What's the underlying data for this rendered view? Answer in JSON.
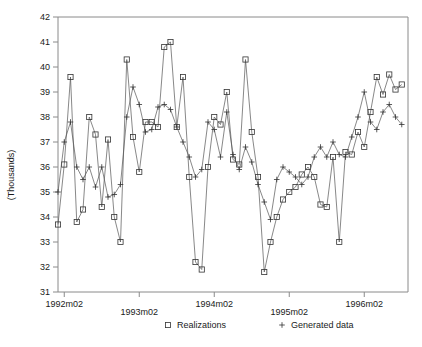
{
  "chart_data": {
    "type": "line",
    "title": "",
    "xlabel": "",
    "ylabel": "(Thousands)",
    "ylim": [
      31,
      42
    ],
    "yticks": [
      31,
      32,
      33,
      34,
      35,
      36,
      37,
      38,
      39,
      40,
      41,
      42
    ],
    "xtick_labels": [
      "1992m02",
      "1993m02",
      "1994m02",
      "1995m02",
      "1996m02"
    ],
    "xtick_months": [
      1,
      13,
      25,
      37,
      49
    ],
    "xlim_months": [
      0,
      56
    ],
    "grid": false,
    "legend_position": "below-axis",
    "legend": [
      {
        "name": "Realizations",
        "marker": "square"
      },
      {
        "name": "Generated data",
        "marker": "plus"
      }
    ],
    "series": [
      {
        "name": "Realizations",
        "marker": "square",
        "color": "#333333",
        "x": [
          0,
          1,
          2,
          3,
          4,
          5,
          6,
          7,
          8,
          9,
          10,
          11,
          12,
          13,
          14,
          15,
          16,
          17,
          18,
          19,
          20,
          21,
          22,
          23,
          24,
          25,
          26,
          27,
          28,
          29,
          30,
          31,
          32,
          33,
          34,
          35,
          36,
          37,
          38,
          39,
          40,
          41,
          42,
          43,
          44,
          45,
          46,
          47,
          48,
          49,
          50,
          51,
          52,
          53,
          54,
          55
        ],
        "values": [
          33.7,
          36.1,
          39.6,
          33.8,
          34.3,
          38.0,
          37.3,
          34.4,
          37.1,
          34.0,
          33.0,
          40.3,
          37.2,
          35.8,
          37.8,
          37.8,
          37.6,
          40.8,
          41.0,
          37.6,
          39.6,
          35.6,
          32.2,
          31.9,
          36.0,
          38.0,
          37.7,
          39.0,
          36.3,
          36.1,
          40.3,
          37.4,
          35.6,
          31.8,
          33.0,
          34.0,
          34.7,
          35.0,
          35.2,
          35.7,
          36.0,
          35.6,
          34.5,
          34.4,
          36.4,
          33.0,
          36.6,
          36.5,
          37.4,
          36.8,
          38.2,
          39.6,
          38.9,
          39.7,
          39.1,
          39.3
        ]
      },
      {
        "name": "Generated data",
        "marker": "plus",
        "color": "#333333",
        "x": [
          0,
          1,
          2,
          3,
          4,
          5,
          6,
          7,
          8,
          9,
          10,
          11,
          12,
          13,
          14,
          15,
          16,
          17,
          18,
          19,
          20,
          21,
          22,
          23,
          24,
          25,
          26,
          27,
          28,
          29,
          30,
          31,
          32,
          33,
          34,
          35,
          36,
          37,
          38,
          39,
          40,
          41,
          42,
          43,
          44,
          45,
          46,
          47,
          48,
          49,
          50,
          51,
          52,
          53,
          54,
          55
        ],
        "values": [
          35.0,
          37.0,
          37.8,
          36.0,
          35.5,
          36.0,
          35.2,
          36.0,
          34.8,
          34.9,
          35.3,
          38.0,
          39.2,
          38.5,
          37.4,
          37.5,
          38.4,
          38.5,
          38.3,
          37.6,
          37.0,
          36.4,
          35.6,
          35.9,
          37.8,
          37.5,
          36.4,
          38.2,
          36.5,
          35.9,
          36.8,
          36.2,
          35.3,
          34.6,
          33.9,
          35.5,
          36.0,
          35.8,
          35.6,
          35.3,
          35.6,
          36.4,
          36.8,
          36.4,
          37.0,
          36.5,
          36.4,
          37.2,
          38.0,
          39.0,
          37.8,
          37.5,
          38.2,
          38.5,
          38.0,
          37.7
        ]
      }
    ]
  },
  "axis": {
    "y_label": "(Thousands)"
  }
}
